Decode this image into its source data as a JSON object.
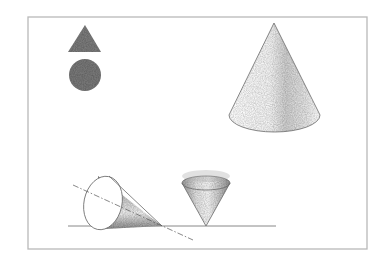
{
  "scene": {
    "width": 384,
    "height": 260,
    "background": "#ffffff",
    "frame": {
      "x": 28,
      "y": 17,
      "w": 339,
      "h": 232,
      "color": "#b9b9b9"
    },
    "shapes": {
      "icon_triangle": {
        "points": "68,52 85,25 101,52",
        "color": "#7b7b7b"
      },
      "icon_circle": {
        "cx": 85,
        "cy": 75,
        "r": 16,
        "color": "#787878"
      },
      "large_cone": {
        "apex": [
          274,
          23
        ],
        "base_left": [
          229,
          115
        ],
        "base_right": [
          320,
          115
        ],
        "base_ry": 17,
        "shading_color": "#a8a8a8"
      },
      "inverted_cone": {
        "apex": [
          206,
          226
        ],
        "rim_cx": 206,
        "rim_cy": 183,
        "rim_rx": 24,
        "rim_ry": 7,
        "shading_color": "#8a8a8a"
      },
      "tipped_cone": {
        "base_cx": 103,
        "base_cy": 203,
        "base_rx": 19,
        "base_ry": 27,
        "apex": [
          162,
          226
        ],
        "shading_color": "#8f8f8f"
      },
      "ground_line": {
        "x1": 68,
        "y1": 226,
        "x2": 276,
        "y2": 226,
        "color": "#7a7a7a"
      },
      "axis_line": {
        "x1": 73,
        "y1": 185,
        "x2": 193,
        "y2": 240
      }
    }
  }
}
